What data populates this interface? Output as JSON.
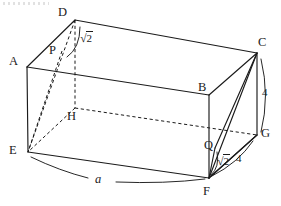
{
  "figure": {
    "type": "geometry-diagram",
    "shape": "rectangular-prism",
    "stroke_color": "#1b1b1b",
    "background_color": "#ffffff",
    "vertices": [
      {
        "id": "D",
        "label": "D",
        "x": 75,
        "y": 20,
        "label_x": 58,
        "label_y": 8
      },
      {
        "id": "C",
        "label": "C",
        "x": 257,
        "y": 53,
        "label_x": 258,
        "label_y": 38
      },
      {
        "id": "A",
        "label": "A",
        "x": 27,
        "y": 67,
        "label_x": 10,
        "label_y": 57
      },
      {
        "id": "B",
        "label": "B",
        "x": 209,
        "y": 95,
        "label_x": 197,
        "label_y": 82
      },
      {
        "id": "H",
        "label": "H",
        "x": 75,
        "y": 108,
        "label_x": 68,
        "label_y": 111
      },
      {
        "id": "G",
        "label": "G",
        "x": 257,
        "y": 135,
        "label_x": 260,
        "label_y": 128
      },
      {
        "id": "E",
        "label": "E",
        "x": 28,
        "y": 152,
        "label_x": 10,
        "label_y": 145
      },
      {
        "id": "F",
        "label": "F",
        "x": 209,
        "y": 178,
        "label_x": 203,
        "label_y": 186
      }
    ],
    "points": [
      {
        "id": "P",
        "label": "P",
        "x": 62,
        "y": 51,
        "label_x": 50,
        "label_y": 45,
        "on_segment": "D-E"
      },
      {
        "id": "Q",
        "label": "Q",
        "x": 215,
        "y": 148,
        "label_x": 205,
        "label_y": 140,
        "on_segment": "C-F"
      }
    ],
    "solid_edges": [
      [
        "A",
        "D"
      ],
      [
        "D",
        "C"
      ],
      [
        "C",
        "B"
      ],
      [
        "B",
        "A"
      ],
      [
        "A",
        "E"
      ],
      [
        "B",
        "F"
      ],
      [
        "C",
        "G"
      ],
      [
        "E",
        "F"
      ],
      [
        "F",
        "G"
      ]
    ],
    "dashed_edges": [
      [
        "D",
        "H"
      ],
      [
        "H",
        "E"
      ],
      [
        "H",
        "G"
      ]
    ],
    "solid_diagonals": [
      [
        "C",
        "F"
      ],
      [
        "C",
        "Q"
      ],
      [
        "F",
        "G"
      ],
      [
        "F",
        "Q"
      ]
    ],
    "dashed_diagonals": [
      [
        "D",
        "E"
      ],
      [
        "D",
        "P"
      ],
      [
        "P",
        "E"
      ]
    ],
    "measurements": [
      {
        "id": "measure-sqrt2-top",
        "symbol": "radical",
        "radicand": "2",
        "text": "√2",
        "label_x": 79,
        "label_y": 39,
        "describes": "arc from D to P",
        "arc": {
          "x1": 79,
          "y1": 26,
          "x2": 68,
          "y2": 56,
          "bulge": 9
        }
      },
      {
        "id": "measure-4-right",
        "symbol": "number",
        "text": "4",
        "label_x": 262,
        "label_y": 92,
        "describes": "arc from C to G",
        "arc": {
          "x1": 261,
          "y1": 58,
          "x2": 261,
          "y2": 132,
          "bulge": 8
        }
      },
      {
        "id": "measure-sqrt2-bottom",
        "symbol": "radical",
        "radicand": "2",
        "text": "√2",
        "label_x": 217,
        "label_y": 161,
        "describes": "arc from Q to F",
        "arc": {
          "x1": 216,
          "y1": 152,
          "x2": 212,
          "y2": 174,
          "bulge": 6
        }
      },
      {
        "id": "measure-4-bottom",
        "symbol": "number",
        "text": "4",
        "label_x": 236,
        "label_y": 158,
        "describes": "arc from G to F",
        "arc": {
          "x1": 253,
          "y1": 140,
          "x2": 213,
          "y2": 176,
          "bulge": 7
        }
      },
      {
        "id": "measure-a-bottom",
        "symbol": "variable",
        "text": "a",
        "label_x": 96,
        "label_y": 180,
        "describes": "arc along E to F",
        "arc_left": {
          "x1": 31,
          "y1": 157,
          "x2": 88,
          "y2": 177,
          "bulge": 5
        },
        "arc_right": {
          "x1": 118,
          "y1": 180,
          "x2": 205,
          "y2": 178,
          "bulge": 5
        }
      }
    ],
    "artifact": {
      "present": true,
      "note": "faint dotted scan artifact at top-left"
    }
  }
}
